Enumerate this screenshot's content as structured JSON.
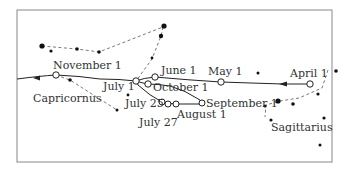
{
  "diagram": {
    "colors": {
      "ink": "#222222",
      "frame": "#777777",
      "text": "#333333",
      "background": "#ffffff"
    },
    "constellations": [
      {
        "name": "Capricornus",
        "label_x": 33,
        "label_y": 102
      },
      {
        "name": "Sagittarius",
        "label_x": 271,
        "label_y": 131
      }
    ],
    "date_labels": [
      {
        "text": "November 1",
        "x": 53,
        "y": 69
      },
      {
        "text": "June 1",
        "x": 161,
        "y": 74
      },
      {
        "text": "May 1",
        "x": 208,
        "y": 75
      },
      {
        "text": "April 1",
        "x": 290,
        "y": 77
      },
      {
        "text": "July 1",
        "x": 102,
        "y": 90
      },
      {
        "text": "October 1",
        "x": 152,
        "y": 91
      },
      {
        "text": "July 25",
        "x": 125,
        "y": 107
      },
      {
        "text": "September 1",
        "x": 207,
        "y": 106
      },
      {
        "text": "August 1",
        "x": 178,
        "y": 117
      },
      {
        "text": "July 27",
        "x": 140,
        "y": 125
      }
    ]
  }
}
